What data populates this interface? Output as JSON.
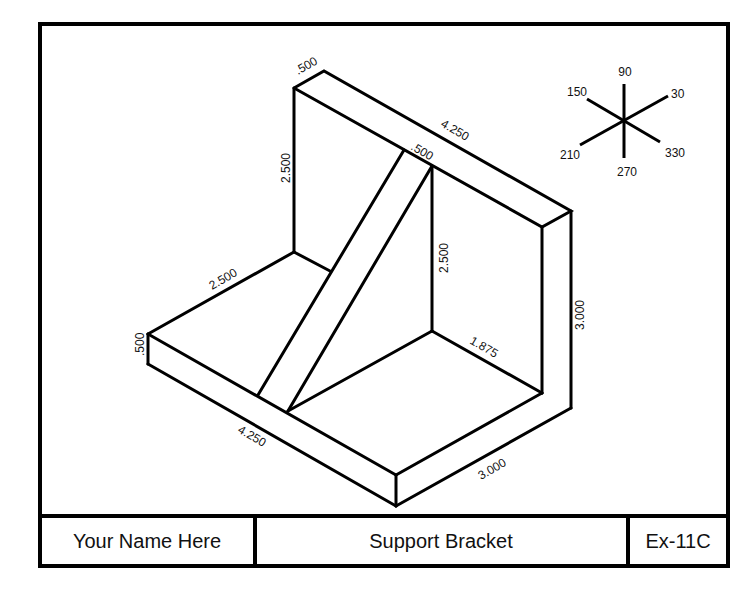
{
  "drawing": {
    "title": "Support Bracket",
    "author": "Your Name Here",
    "exercise_id": "Ex-11C",
    "line_color": "#000000",
    "background": "#ffffff"
  },
  "title_block": {
    "cells": [
      {
        "label": "Your Name Here"
      },
      {
        "label": "Support Bracket"
      },
      {
        "label": "Ex-11C"
      }
    ]
  },
  "dimensions": {
    "back_top_thickness": ".500",
    "back_upright_height": "2.500",
    "back_top_length": "4.250",
    "rib_thickness": ".500",
    "rib_height": "2.500",
    "overall_height": "3.000",
    "base_depth_left": "2.500",
    "base_thickness": ".500",
    "base_inner_depth": "1.875",
    "base_front_length": "4.250",
    "base_width": "3.000"
  },
  "iso_axes": {
    "labels": [
      "90",
      "30",
      "330",
      "270",
      "210",
      "150"
    ]
  }
}
